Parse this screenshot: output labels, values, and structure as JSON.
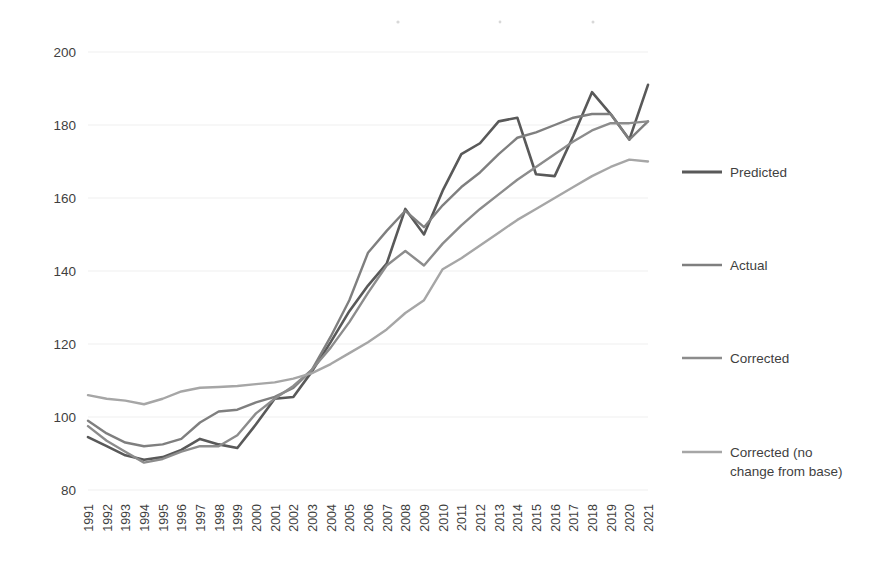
{
  "chart_data": {
    "type": "line",
    "title": "",
    "subtitle": "",
    "xlabel": "",
    "ylabel": "",
    "grid": true,
    "legend_position": "right",
    "ylim": [
      80,
      200
    ],
    "yticks": [
      80,
      100,
      120,
      140,
      160,
      180,
      200
    ],
    "ytick_labels": [
      "80",
      "100",
      "120",
      "140",
      "160",
      "180",
      "200"
    ],
    "categories": [
      "1991",
      "1992",
      "1993",
      "1994",
      "1995",
      "1996",
      "1997",
      "1998",
      "1999",
      "2000",
      "2001",
      "2002",
      "2003",
      "2004",
      "2005",
      "2006",
      "2007",
      "2008",
      "2009",
      "2010",
      "2011",
      "2012",
      "2013",
      "2014",
      "2015",
      "2016",
      "2017",
      "2018",
      "2019",
      "2020",
      "2021"
    ],
    "series": [
      {
        "name": "Predicted",
        "color": "#595959",
        "values": [
          94.5,
          92.0,
          89.5,
          88.3,
          89.0,
          91.0,
          94.0,
          92.5,
          91.5,
          98.0,
          105.0,
          105.5,
          112.5,
          120.5,
          129.0,
          136.0,
          142.0,
          157.0,
          150.0,
          162.0,
          172.0,
          175.0,
          181.0,
          182.0,
          166.5,
          166.0,
          177.0,
          189.0,
          183.0,
          176.0,
          191.0
        ]
      },
      {
        "name": "Actual",
        "color": "#7f7f7f",
        "values": [
          99.0,
          95.5,
          93.0,
          92.0,
          92.5,
          94.0,
          98.5,
          101.5,
          102.0,
          104.0,
          105.5,
          108.0,
          113.0,
          122.0,
          132.0,
          145.0,
          151.0,
          156.5,
          152.0,
          158.0,
          163.0,
          167.0,
          172.0,
          176.5,
          178.0,
          180.0,
          182.0,
          183.0,
          183.0,
          176.0,
          181.0
        ]
      },
      {
        "name": "Corrected",
        "color": "#8c8c8c",
        "values": [
          97.5,
          93.5,
          90.5,
          87.5,
          88.5,
          90.5,
          92.0,
          92.0,
          95.0,
          101.0,
          105.0,
          108.5,
          113.0,
          119.0,
          126.0,
          134.0,
          141.5,
          145.5,
          141.5,
          147.5,
          152.5,
          157.0,
          161.0,
          165.0,
          168.5,
          172.0,
          175.5,
          178.5,
          180.5,
          180.5,
          181.0
        ]
      },
      {
        "name": "Corrected (no change from base)",
        "color": "#a6a6a6",
        "values": [
          106.0,
          105.0,
          104.5,
          103.5,
          105.0,
          107.0,
          108.0,
          108.2,
          108.5,
          109.0,
          109.5,
          110.5,
          112.0,
          114.5,
          117.5,
          120.5,
          124.0,
          128.5,
          132.0,
          140.5,
          143.5,
          147.0,
          150.5,
          154.0,
          157.0,
          160.0,
          163.0,
          166.0,
          168.5,
          170.5,
          170.0
        ]
      }
    ]
  },
  "legend": {
    "items": [
      {
        "label": "Predicted",
        "color": "#595959"
      },
      {
        "label": "Actual",
        "color": "#7f7f7f"
      },
      {
        "label": "Corrected",
        "color": "#8c8c8c"
      },
      {
        "label": "Corrected (no",
        "label_line2": "change from base)",
        "color": "#a6a6a6"
      }
    ]
  }
}
